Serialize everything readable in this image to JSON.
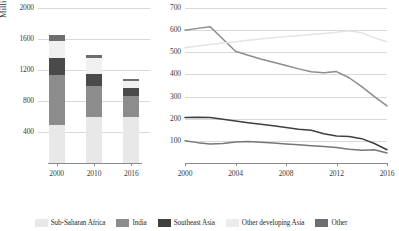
{
  "chart_data": [
    {
      "type": "bar",
      "id": "stacked-population-bars",
      "title": "",
      "xlabel": "",
      "ylabel": "Million People",
      "categories": [
        "2000",
        "2010",
        "2016"
      ],
      "ylim": [
        0,
        2000
      ],
      "yticks": [
        400,
        800,
        1200,
        1600,
        2000
      ],
      "grid": true,
      "stacked": true,
      "legend_position": "bottom",
      "series": [
        {
          "name": "Sub-Saharan Africa",
          "color": "#e8e8e8",
          "values": [
            490,
            600,
            600
          ]
        },
        {
          "name": "India",
          "color": "#8c8c8c",
          "values": [
            640,
            390,
            270
          ]
        },
        {
          "name": "Southeast Asia",
          "color": "#4a4a4a",
          "values": [
            220,
            155,
            95
          ]
        },
        {
          "name": "Other developing Asia",
          "color": "#f0f0f0",
          "values": [
            230,
            205,
            90
          ]
        },
        {
          "name": "Other",
          "color": "#6e6e6e",
          "values": [
            70,
            50,
            25
          ]
        }
      ],
      "totals": [
        1650,
        1400,
        1080
      ]
    },
    {
      "type": "line",
      "id": "population-trend-lines",
      "title": "",
      "xlabel": "",
      "ylabel": "",
      "x": [
        2000,
        2001,
        2002,
        2003,
        2004,
        2005,
        2006,
        2007,
        2008,
        2009,
        2010,
        2011,
        2012,
        2013,
        2014,
        2015,
        2016
      ],
      "xticks": [
        2000,
        2004,
        2008,
        2012,
        2016
      ],
      "ylim": [
        0,
        700
      ],
      "yticks": [
        100,
        200,
        300,
        400,
        500,
        600,
        700
      ],
      "grid": true,
      "legend_position": "bottom",
      "series": [
        {
          "name": "India",
          "color": "#8c8c8c",
          "values": [
            600,
            608,
            615,
            560,
            505,
            487,
            470,
            455,
            440,
            425,
            412,
            408,
            413,
            385,
            345,
            300,
            258
          ]
        },
        {
          "name": "Other developing Asia",
          "color": "#e4e4e4",
          "values": [
            520,
            528,
            535,
            542,
            548,
            554,
            560,
            566,
            571,
            575,
            580,
            585,
            590,
            597,
            588,
            565,
            548
          ]
        },
        {
          "name": "Southeast Asia",
          "color": "#3f3f3f",
          "values": [
            205,
            207,
            205,
            198,
            190,
            182,
            175,
            168,
            160,
            152,
            148,
            132,
            122,
            120,
            110,
            88,
            60
          ]
        },
        {
          "name": "Other",
          "color": "#777777",
          "values": [
            100,
            92,
            86,
            88,
            95,
            97,
            94,
            90,
            86,
            82,
            78,
            74,
            70,
            62,
            58,
            60,
            45
          ]
        }
      ]
    }
  ],
  "legend": {
    "items": [
      {
        "label": "Sub-Saharan Africa",
        "color": "#e8e8e8"
      },
      {
        "label": "India",
        "color": "#8c8c8c"
      },
      {
        "label": "Southeast Asia",
        "color": "#3f3f3f"
      },
      {
        "label": "Other developing Asia",
        "color": "#ececec"
      },
      {
        "label": "Other",
        "color": "#6e6e6e"
      }
    ]
  }
}
